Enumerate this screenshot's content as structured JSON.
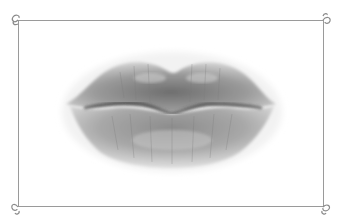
{
  "image": {
    "subject": "pencil drawing of lips",
    "alt": "Graphite sketch of puckered lips inside a thin decorative frame",
    "colors": {
      "background": "#ffffff",
      "frame": "#9a9a9a",
      "lip_dark": "#4a4a4a",
      "lip_mid": "#8a8a8a",
      "lip_light": "#c4c4c4"
    }
  },
  "frame": {
    "style": "thin line border with curl ornaments at corners",
    "corners": [
      "top-left-curl",
      "top-right-curl",
      "bottom-left-curl",
      "bottom-right-curl"
    ]
  }
}
